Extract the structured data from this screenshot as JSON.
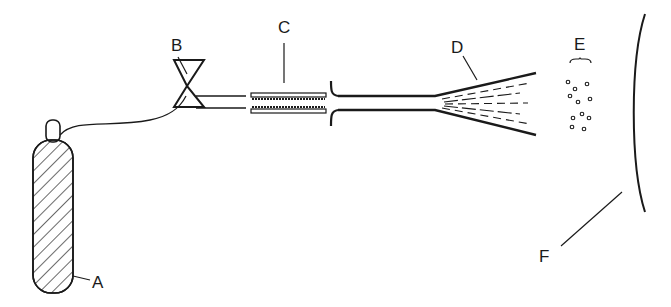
{
  "diagram": {
    "type": "apparatus schematic",
    "colors": {
      "ink": "#1a1a1a",
      "background": "#ffffff"
    },
    "components": [
      {
        "id": "A",
        "label": "A",
        "depicts": "gas cylinder (hatched)"
      },
      {
        "id": "B",
        "label": "B",
        "depicts": "valve (bowtie symbol)"
      },
      {
        "id": "C",
        "label": "C",
        "depicts": "heated tube / plates"
      },
      {
        "id": "D",
        "label": "D",
        "depicts": "expansion nozzle with spray"
      },
      {
        "id": "E",
        "label": "E",
        "depicts": "particles / droplets"
      },
      {
        "id": "F",
        "label": "F",
        "depicts": "curved screen / collector"
      }
    ],
    "labels": {
      "A": "A",
      "B": "B",
      "C": "C",
      "D": "D",
      "E": "E",
      "F": "F"
    }
  }
}
